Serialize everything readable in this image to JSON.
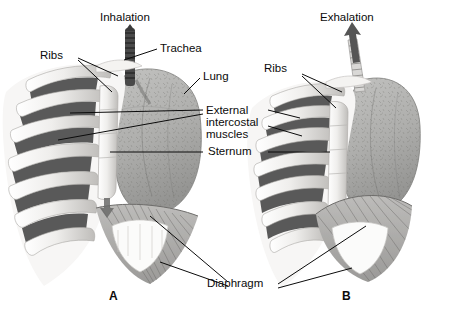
{
  "figure": {
    "background_color": "#ffffff",
    "ink_color": "#0b0b0b",
    "width": 451,
    "height": 328
  },
  "panels": [
    {
      "id": "A",
      "title": "Inhalation",
      "marker": "A",
      "airflow_direction": "in",
      "diaphragm_state": "contracted-flattened-descended",
      "ribcage_state": "elevated-expanded"
    },
    {
      "id": "B",
      "title": "Exhalation",
      "marker": "B",
      "airflow_direction": "out",
      "diaphragm_state": "relaxed-domed-raised",
      "ribcage_state": "lowered-compressed"
    }
  ],
  "labels": {
    "ribs_left": "Ribs",
    "ribs_right": "Ribs",
    "trachea": "Trachea",
    "lung": "Lung",
    "external_line1": "External",
    "external_line2": "intercostal",
    "external_line3": "muscles",
    "sternum": "Sternum",
    "diaphragm": "Diaphragm"
  },
  "palette": {
    "bone": "#f2f1ef",
    "bone_shade": "#c9c7c4",
    "intercostal_dark": "#4c4c4c",
    "lung_tissue": "#b2b2b0",
    "lung_tissue_dark": "#8f8f8d",
    "diaphragm_muscle": "#a9a8a6",
    "trachea_dark": "#3a3a3a",
    "trachea_light": "#d5d4d2",
    "arrow_dark": "#555555"
  }
}
